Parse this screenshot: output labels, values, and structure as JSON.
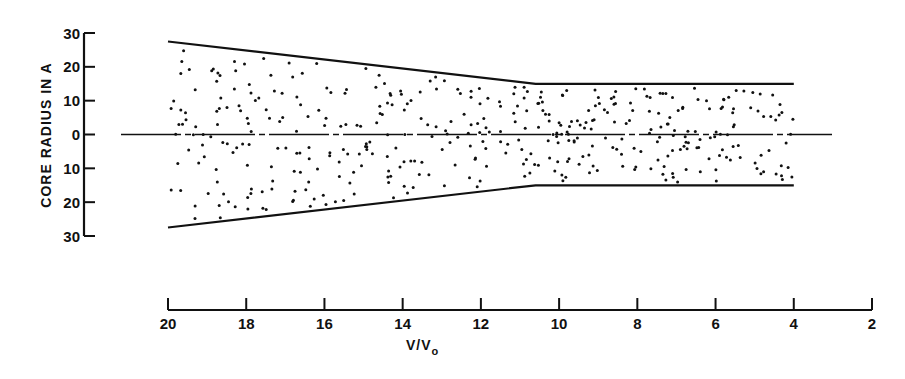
{
  "chart_data": {
    "type": "area",
    "title": "",
    "xlabel": "V/V0",
    "xlabel_main": "V/V",
    "xlabel_sub": "o",
    "ylabel": "CORE RADIUS IN A",
    "x_ticks": [
      20,
      18,
      16,
      14,
      12,
      10,
      8,
      6,
      4,
      2
    ],
    "x_tick_labels": [
      "20",
      "18",
      "16",
      "14",
      "12",
      "10",
      "8",
      "6",
      "4",
      "2"
    ],
    "y_ticks": [
      30,
      20,
      10,
      0,
      -10,
      -20,
      -30
    ],
    "y_tick_labels": [
      "30",
      "20",
      "10",
      "0",
      "10",
      "20",
      "30"
    ],
    "xlim": [
      20,
      2
    ],
    "ylim": [
      -30,
      30
    ],
    "x_reversed": true,
    "grid": false,
    "legend": null,
    "series": [
      {
        "name": "upper core boundary",
        "x": [
          20,
          10.6,
          4
        ],
        "y": [
          27.5,
          15,
          15
        ]
      },
      {
        "name": "lower core boundary",
        "x": [
          20,
          10.6,
          4
        ],
        "y": [
          -27.5,
          -15,
          -15
        ]
      }
    ],
    "centerline": {
      "y": 0,
      "style": "dash-dot",
      "x_start": 21,
      "x_end": 3
    },
    "fill": "stippled dots",
    "dot_count": 420
  },
  "colors": {
    "ink": "#111111",
    "background": "#ffffff"
  }
}
